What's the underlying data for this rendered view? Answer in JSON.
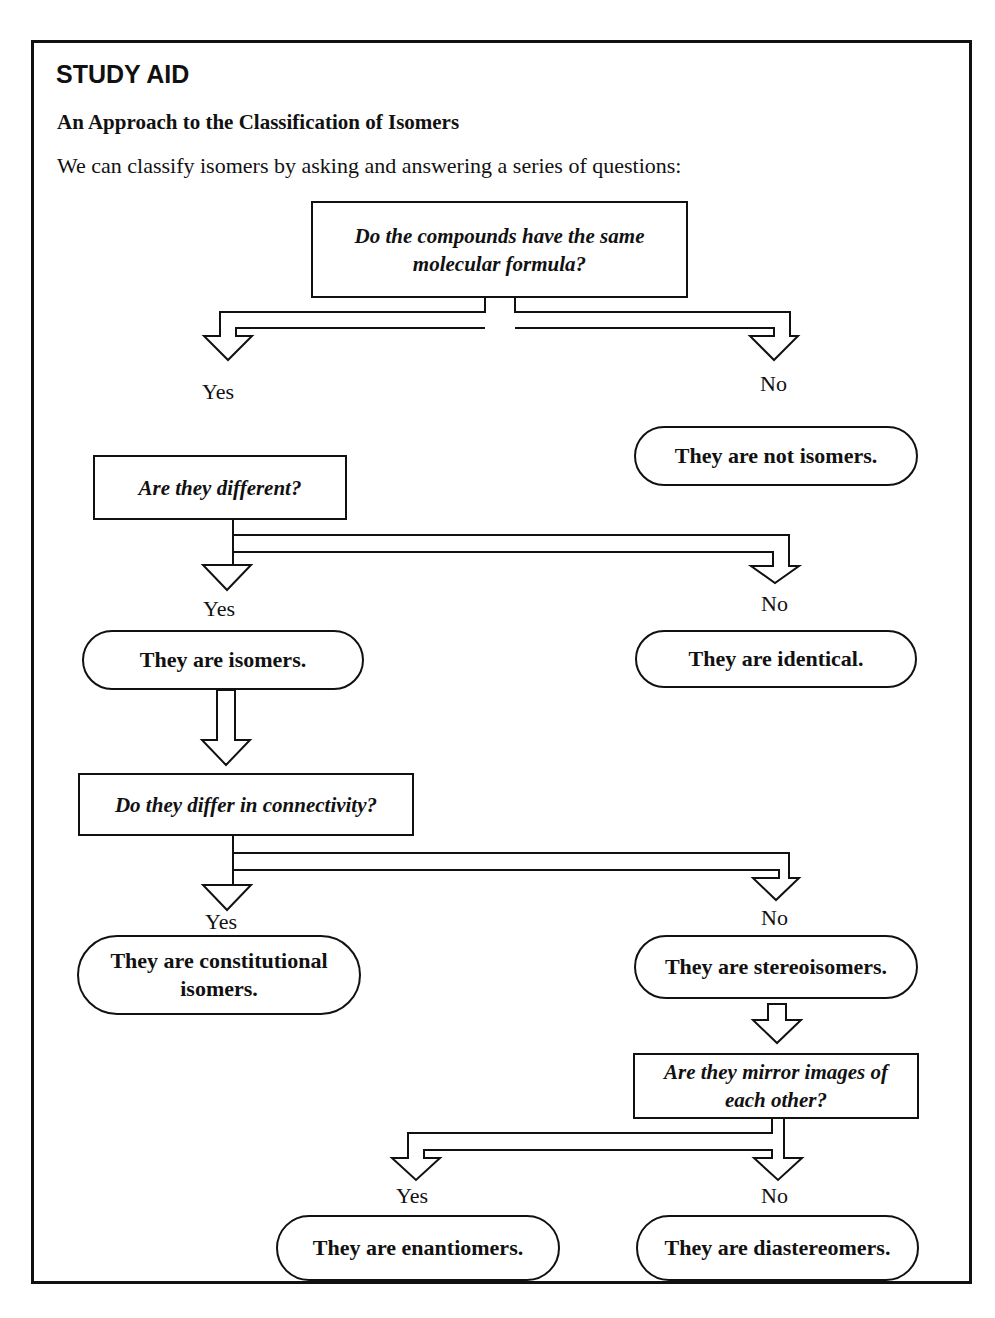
{
  "header": {
    "label": "STUDY AID",
    "title": "An Approach to the Classification of Isomers",
    "intro": "We can classify isomers by asking and answering a series of questions:"
  },
  "questions": [
    {
      "id": "q1",
      "text": "Do the compounds have the same molecular formula?"
    },
    {
      "id": "q2",
      "text": "Are they different?"
    },
    {
      "id": "q3",
      "text": "Do they differ in connectivity?"
    },
    {
      "id": "q4",
      "text": "Are they mirror images of each other?"
    }
  ],
  "outcomes": [
    {
      "id": "o1",
      "text": "They are not isomers."
    },
    {
      "id": "o2",
      "text": "They are isomers."
    },
    {
      "id": "o3",
      "text": "They are identical."
    },
    {
      "id": "o4",
      "text": "They are constitutional isomers."
    },
    {
      "id": "o5",
      "text": "They are stereoisomers."
    },
    {
      "id": "o6",
      "text": "They are enantiomers."
    },
    {
      "id": "o7",
      "text": "They are diastereomers."
    }
  ],
  "labels": {
    "yes": "Yes",
    "no": "No"
  },
  "colors": {
    "ink": "#111111",
    "background": "#ffffff"
  }
}
